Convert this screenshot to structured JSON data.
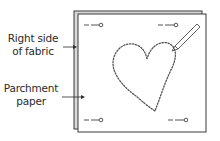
{
  "labels": {
    "fabric_line1": "Right side",
    "fabric_line2": "of fabric",
    "parchment_line1": "Parchment",
    "parchment_line2": "paper"
  },
  "colors": {
    "outline": "#3a3a3a",
    "back_sheet": "#bdbdbd",
    "front_sheet": "#ffffff",
    "stitch": "#555555",
    "pin": "#555555"
  },
  "elements": {
    "pins": [
      "top-left-pin",
      "top-right-pin",
      "bottom-left-pin",
      "bottom-right-pin"
    ],
    "shape": "heart",
    "tool": "pencil"
  }
}
